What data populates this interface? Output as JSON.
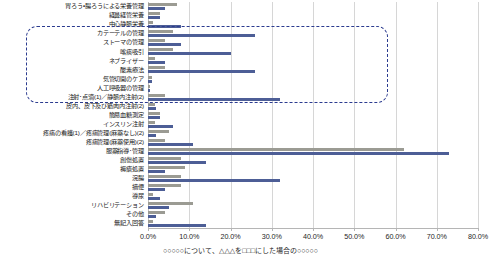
{
  "chart_data": {
    "type": "bar",
    "orientation": "horizontal",
    "title": "",
    "xlabel": "",
    "ylabel": "",
    "xlim": [
      0,
      80
    ],
    "xunit": "%",
    "grid": true,
    "legend": "none",
    "xticks": [
      "0.0%",
      "10.0%",
      "20.0%",
      "30.0%",
      "40.0%",
      "50.0%",
      "60.0%",
      "70.0%",
      "80.0%"
    ],
    "xtick_values": [
      0,
      10,
      20,
      30,
      40,
      50,
      60,
      70,
      80
    ],
    "categories": [
      "胃ろう・腸ろうによる栄養管理",
      "経鼻経管栄養",
      "中心静脈栄養",
      "カテーテルの管理",
      "ストーマの管理",
      "喀痰吸引",
      "ネブライザー",
      "酸素療法",
      "気管切開のケア",
      "人工呼吸器の管理",
      "注射･点滴(1)／静脈内注射(2)",
      "皮内、皮下及び筋肉内注射(2)",
      "簡易血糖測定",
      "インスリン注射",
      "疼痛の看護(1)／疼痛管理(麻薬なし)(2)",
      "疼痛管理(麻薬使用)(2)",
      "服薬指導･管理",
      "創傷処置",
      "褥瘡処置",
      "浣腸",
      "摘便",
      "導尿",
      "リハビリテーション",
      "その他",
      "無記入回答"
    ],
    "series": [
      {
        "name": "series-1",
        "color": "#9b9b93",
        "values": [
          7.0,
          3.0,
          1.2,
          6.0,
          4.0,
          6.0,
          1.6,
          4.0,
          1.0,
          0.6,
          4.0,
          1.6,
          3.0,
          1.6,
          5.0,
          4.0,
          62.0,
          8.0,
          9.0,
          8.0,
          8.0,
          1.2,
          11.0,
          4.0,
          1.2
        ]
      },
      {
        "name": "series-2",
        "color": "#4d5e96",
        "values": [
          4.0,
          3.0,
          8.0,
          26.0,
          8.0,
          20.0,
          4.0,
          26.0,
          1.0,
          0.6,
          32.0,
          2.0,
          3.0,
          6.0,
          2.0,
          11.0,
          73.0,
          14.0,
          4.0,
          32.0,
          4.0,
          3.0,
          5.0,
          2.0,
          14.0
        ]
      }
    ],
    "annotation": {
      "type": "dashed-rounded-rectangle",
      "color": "#2b3b8f",
      "from_category": "カテーテルの管理",
      "to_category": "注射･点滴(1)／静脈内注射(2)"
    }
  },
  "caption": "○○○○○について、△△△を□□□にした場合の○○○○○",
  "colors": {
    "series_1": "#9b9b93",
    "series_2": "#4d5e96",
    "gridline": "#d6d6d6",
    "axis": "#b5b5b5",
    "annotation": "#2b3b8f",
    "background": "#ffffff"
  }
}
